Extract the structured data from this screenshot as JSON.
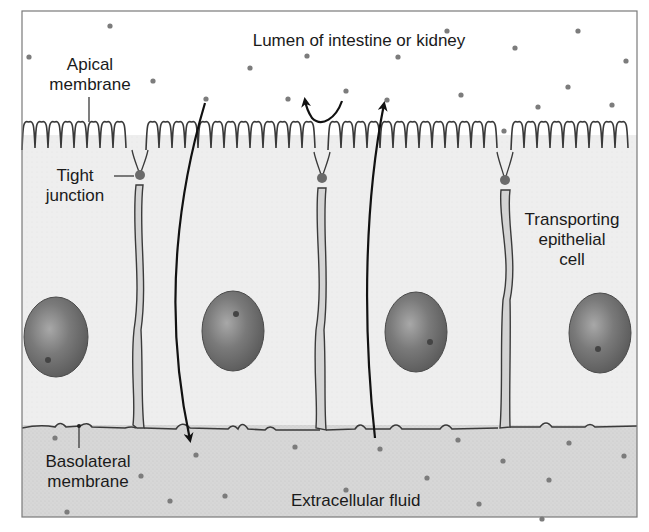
{
  "colors": {
    "lumen_bg": "#ffffff",
    "cell_bg": "#ececec",
    "ecf_bg": "#d6d6d6",
    "frame": "#7a7a7a",
    "membrane": "#3a3a3a",
    "junction": "#6a6a6a",
    "particle": "#7c7c7c",
    "nucleus": "#6e6e6e",
    "arrow": "#111111"
  },
  "labels": {
    "lumen": "Lumen of intestine or kidney",
    "apical_line1": "Apical",
    "apical_line2": "membrane",
    "tight_line1": "Tight",
    "tight_line2": "junction",
    "transporting_line1": "Transporting",
    "transporting_line2": "epithelial",
    "transporting_line3": "cell",
    "basolateral_line1": "Basolateral",
    "basolateral_line2": "membrane",
    "ecf": "Extracellular fluid"
  },
  "structure": {
    "cells": 4,
    "cell_boundaries_x": [
      140,
      322,
      505
    ],
    "tight_junctions": [
      {
        "x": 140,
        "y": 175
      },
      {
        "x": 322,
        "y": 178
      },
      {
        "x": 505,
        "y": 180
      }
    ],
    "nuclei": [
      {
        "cx": 56,
        "cy": 337,
        "rx": 32,
        "ry": 40
      },
      {
        "cx": 233,
        "cy": 331,
        "rx": 31,
        "ry": 40
      },
      {
        "cx": 416,
        "cy": 332,
        "rx": 31,
        "ry": 40
      },
      {
        "cx": 600,
        "cy": 333,
        "rx": 31,
        "ry": 40
      }
    ],
    "arrows": [
      {
        "name": "paracellular-secretion-arrow",
        "direction": "lumen-to-ecf",
        "from": [
          205,
          100
        ],
        "to": [
          190,
          445
        ]
      },
      {
        "name": "reabsorption-arrow",
        "direction": "ecf-to-lumen",
        "from": [
          373,
          440
        ],
        "to": [
          385,
          100
        ]
      },
      {
        "name": "recycle-arrow",
        "direction": "curved-back-to-lumen",
        "from": [
          342,
          99
        ],
        "to": [
          306,
          102
        ]
      }
    ]
  }
}
